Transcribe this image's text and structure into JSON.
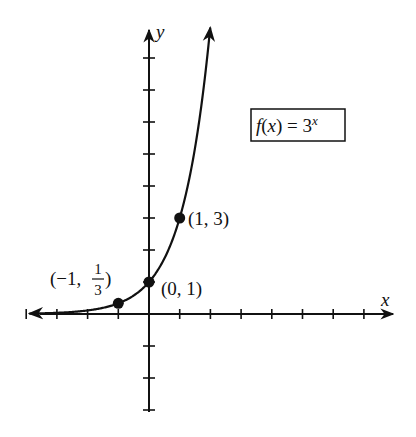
{
  "chart_data": {
    "type": "line",
    "title": "",
    "function_label": "f(x) = 3^x",
    "function_label_parts": {
      "f": "f",
      "open": "(",
      "x": "x",
      "close": ") = 3",
      "exp": "x"
    },
    "xlabel": "x",
    "ylabel": "y",
    "xlim": [
      -4,
      8
    ],
    "ylim": [
      -3,
      9
    ],
    "grid": false,
    "x_ticks": [
      -4,
      -3,
      -2,
      -1,
      1,
      2,
      3,
      4,
      5,
      6,
      7
    ],
    "y_ticks": [
      -3,
      -2,
      -1,
      1,
      2,
      3,
      4,
      5,
      6,
      7,
      8
    ],
    "series": [
      {
        "name": "f(x) = 3^x",
        "expression": "3^x",
        "x": [
          -4,
          -3,
          -2,
          -1,
          0,
          1,
          1.5,
          2
        ],
        "values": [
          0.012,
          0.037,
          0.111,
          0.333,
          1,
          3,
          5.196,
          9
        ]
      }
    ],
    "points": [
      {
        "x": -1,
        "y": 0.3333,
        "label": "(-1, 1/3)"
      },
      {
        "x": 0,
        "y": 1,
        "label": "(0, 1)"
      },
      {
        "x": 1,
        "y": 3,
        "label": "(1, 3)"
      }
    ]
  },
  "labels": {
    "p_neg1_open": "(−1, ",
    "p_neg1_num": "1",
    "p_neg1_den": "3",
    "p_neg1_close": ")",
    "p_zero": "(0, 1)",
    "p_one": "(1, 3)",
    "axis_x": "x",
    "axis_y": "y"
  }
}
